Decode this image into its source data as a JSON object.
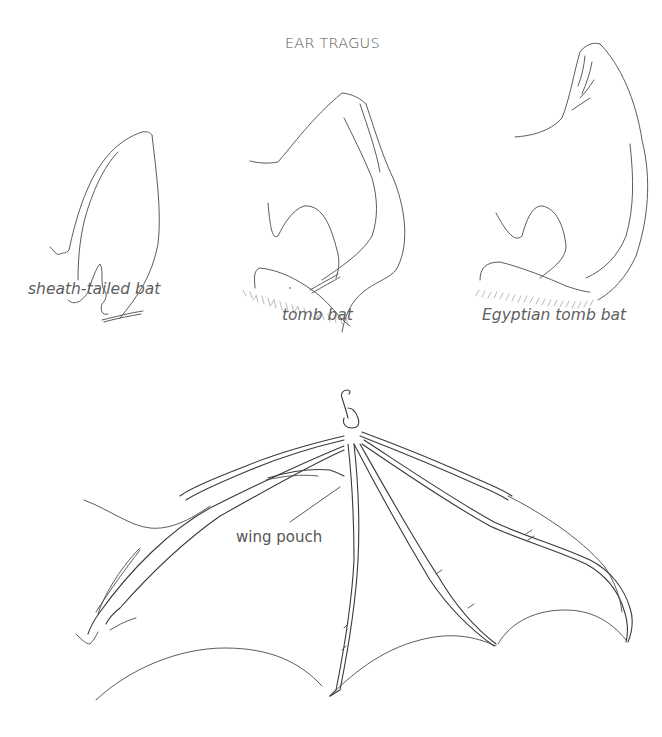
{
  "figure": {
    "title": "EAR TRAGUS",
    "ears": [
      {
        "id": "sheath-tailed",
        "caption": "sheath-tailed bat"
      },
      {
        "id": "tomb",
        "caption": "tomb bat"
      },
      {
        "id": "egyptian-tomb",
        "caption": "Egyptian tomb bat"
      }
    ],
    "wing": {
      "annotations": [
        {
          "label": "wing pouch"
        }
      ]
    }
  },
  "colors": {
    "background": "#ffffff",
    "line": "#4a4a4a",
    "text": "#5a5a5a"
  }
}
